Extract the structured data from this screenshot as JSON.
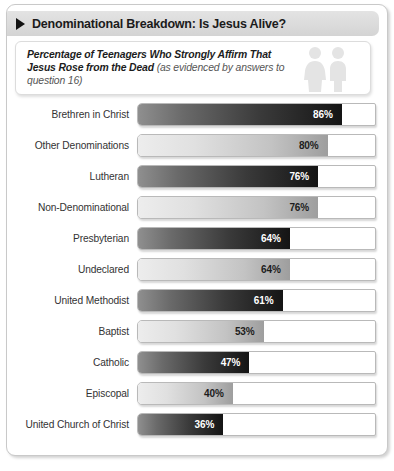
{
  "header": {
    "title": "Denominational Breakdown: Is Jesus Alive?",
    "disclosure_icon": "triangle-right-icon"
  },
  "subtitle": {
    "main": "Percentage of Teenagers Who Strongly Affirm That Jesus Rose from the Dead ",
    "note": "(as evidenced by answers to question 16)",
    "icon": "two-people-icon"
  },
  "chart_data": {
    "type": "bar",
    "orientation": "horizontal",
    "title": "Denominational Breakdown: Is Jesus Alive?",
    "subtitle": "Percentage of Teenagers Who Strongly Affirm That Jesus Rose from the Dead (as evidenced by answers to question 16)",
    "xlabel": "",
    "ylabel": "",
    "xlim": [
      0,
      100
    ],
    "grid": false,
    "legend": false,
    "value_suffix": "%",
    "categories": [
      "Brethren in Christ",
      "Other Denominations",
      "Lutheran",
      "Non-Denominational",
      "Presbyterian",
      "Undeclared",
      "United Methodist",
      "Baptist",
      "Catholic",
      "Episcopal",
      "United Church of Christ"
    ],
    "values": [
      86,
      80,
      76,
      76,
      64,
      64,
      61,
      53,
      47,
      40,
      36
    ],
    "labels": [
      "86%",
      "80%",
      "76%",
      "76%",
      "64%",
      "64%",
      "61%",
      "53%",
      "47%",
      "40%",
      "36%"
    ],
    "bar_styles": [
      "dark",
      "light",
      "dark",
      "light",
      "dark",
      "light",
      "dark",
      "light",
      "dark",
      "light",
      "dark"
    ]
  },
  "colors": {
    "header_band": "#dcdcdc",
    "card_border": "#c9c9c9",
    "dark_bar_start": "#8f8f8f",
    "dark_bar_end": "#141414",
    "light_bar_start": "#ededed",
    "light_bar_end": "#9e9e9e",
    "label_text": "#333333"
  }
}
